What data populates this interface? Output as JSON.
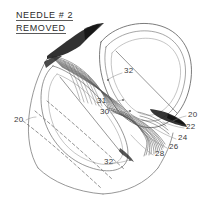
{
  "figure": {
    "type": "patent-line-drawing",
    "background_color": "#ffffff",
    "line_color": "#4a4a4a",
    "dark_accent_color": "#1a1a1a"
  },
  "caption": {
    "line1": "NEEDLE # 2",
    "line2": "REMOVED"
  },
  "reference_numerals": [
    {
      "id": "ref-20-left",
      "label": "20",
      "x": 14,
      "y": 119
    },
    {
      "id": "ref-32-upper",
      "label": "32",
      "x": 124,
      "y": 70
    },
    {
      "id": "ref-31",
      "label": "31",
      "x": 97,
      "y": 100
    },
    {
      "id": "ref-30",
      "label": "30",
      "x": 100,
      "y": 111
    },
    {
      "id": "ref-20-right",
      "label": "20",
      "x": 188,
      "y": 114
    },
    {
      "id": "ref-22",
      "label": "22",
      "x": 186,
      "y": 126
    },
    {
      "id": "ref-24",
      "label": "24",
      "x": 178,
      "y": 137
    },
    {
      "id": "ref-26",
      "label": "26",
      "x": 169,
      "y": 146
    },
    {
      "id": "ref-28",
      "label": "28",
      "x": 155,
      "y": 153
    },
    {
      "id": "ref-32-lower",
      "label": "32",
      "x": 104,
      "y": 161
    }
  ]
}
